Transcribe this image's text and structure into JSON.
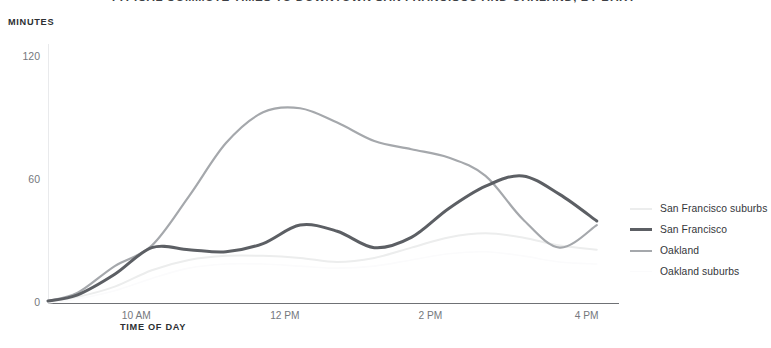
{
  "header": {
    "title": "TYPICAL COMMUTE TIMES TO DOWNTOWN SAN FRANCISCO AND OAKLAND, BY BART",
    "title_clipped": true
  },
  "axes": {
    "y_title": "MINUTES",
    "x_title": "TIME OF DAY",
    "y_ticks": [
      "0",
      "60",
      "120"
    ],
    "x_ticks": [
      "10 AM",
      "12 PM",
      "2 PM",
      "4 PM"
    ]
  },
  "legend": {
    "position": "right",
    "items": [
      {
        "label": "San Francisco suburbs",
        "color": "#eceded",
        "width": 2.0
      },
      {
        "label": "San Francisco",
        "color": "#5c5f64",
        "width": 3.0
      },
      {
        "label": "Oakland",
        "color": "#a5a8ac",
        "width": 2.2
      },
      {
        "label": "Oakland suburbs",
        "color": "#fbfbfc",
        "width": 1.6
      }
    ]
  },
  "chart_data": {
    "type": "line",
    "title": "TYPICAL COMMUTE TIMES TO DOWNTOWN SAN FRANCISCO AND OAKLAND, BY BART",
    "xlabel": "TIME OF DAY",
    "ylabel": "MINUTES",
    "ylim": [
      0,
      130
    ],
    "xlim": [
      8.6,
      16.3
    ],
    "grid": false,
    "legend_position": "right",
    "x": [
      8.6,
      9,
      9.5,
      10,
      10.5,
      11,
      11.5,
      12,
      12.5,
      13,
      13.5,
      14,
      14.5,
      15,
      15.5,
      16
    ],
    "x_tick_values": [
      10,
      12,
      14,
      16
    ],
    "series": [
      {
        "name": "San Francisco suburbs",
        "color": "#eceded",
        "values": [
          1,
          3,
          8,
          16,
          21,
          23,
          23,
          22,
          20,
          22,
          27,
          32,
          34,
          32,
          28,
          26
        ]
      },
      {
        "name": "San Francisco",
        "color": "#5c5f64",
        "values": [
          1,
          4,
          14,
          27,
          26,
          25,
          29,
          38,
          35,
          27,
          32,
          46,
          57,
          62,
          53,
          40
        ]
      },
      {
        "name": "Oakland",
        "color": "#a5a8ac",
        "values": [
          1,
          5,
          18,
          28,
          52,
          78,
          93,
          95,
          88,
          79,
          75,
          71,
          62,
          41,
          27,
          38
        ]
      },
      {
        "name": "Oakland suburbs",
        "color": "#fbfbfc",
        "values": [
          0,
          2,
          6,
          12,
          17,
          19,
          19,
          18,
          17,
          18,
          21,
          24,
          25,
          23,
          20,
          19
        ]
      }
    ]
  }
}
